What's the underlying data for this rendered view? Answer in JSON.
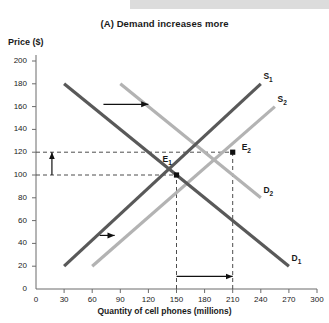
{
  "chart_data": {
    "type": "line",
    "title": "(A) Demand increases more",
    "xlabel": "Quantity of cell phones (millions)",
    "ylabel": "Price ($)",
    "xlim": [
      0,
      300
    ],
    "ylim": [
      0,
      200
    ],
    "xticks": [
      "0",
      "30",
      "60",
      "90",
      "120",
      "150",
      "180",
      "210",
      "240",
      "270",
      "300"
    ],
    "yticks": [
      "0",
      "20",
      "40",
      "60",
      "80",
      "100",
      "120",
      "140",
      "160",
      "180",
      "200"
    ],
    "grid": false,
    "legend_position": "inline-curve-labels",
    "series": [
      {
        "name": "D1",
        "label": "D",
        "sub": "1",
        "kind": "demand",
        "color": "#595959",
        "x": [
          30,
          270
        ],
        "y": [
          180,
          20
        ],
        "label_x": 276,
        "label_y": 26
      },
      {
        "name": "D2",
        "label": "D",
        "sub": "2",
        "kind": "demand",
        "color": "#b3b3b3",
        "x": [
          90,
          240
        ],
        "y": [
          180,
          80
        ],
        "label_x": 246,
        "label_y": 86
      },
      {
        "name": "S1",
        "label": "S",
        "sub": "1",
        "kind": "supply",
        "color": "#595959",
        "x": [
          30,
          240
        ],
        "y": [
          20,
          180
        ],
        "label_x": 246,
        "label_y": 186
      },
      {
        "name": "S2",
        "label": "S",
        "sub": "2",
        "kind": "supply",
        "color": "#b3b3b3",
        "x": [
          60,
          255
        ],
        "y": [
          20,
          160
        ],
        "label_x": 261,
        "label_y": 166
      }
    ],
    "points": [
      {
        "name": "E1",
        "label": "E",
        "sub": "1",
        "x": 150,
        "y": 100,
        "label_dx": -14,
        "label_dy": 15
      },
      {
        "name": "E2",
        "label": "E",
        "sub": "2",
        "x": 210,
        "y": 120,
        "label_dx": 9,
        "label_dy": 4
      }
    ],
    "guides": [
      {
        "name": "price-e1-guide",
        "orient": "h",
        "value": 100,
        "from": 0,
        "to": 150
      },
      {
        "name": "price-e2-guide",
        "orient": "h",
        "value": 120,
        "from": 0,
        "to": 210
      },
      {
        "name": "quantity-e1-guide",
        "orient": "v",
        "value": 150,
        "from": 0,
        "to": 100
      },
      {
        "name": "quantity-e2-guide",
        "orient": "v",
        "value": 210,
        "from": 0,
        "to": 120
      }
    ],
    "annotations": [
      {
        "name": "demand-shift-arrow",
        "dir": "right",
        "x1": 72,
        "y1": 162,
        "x2": 120,
        "y2": 162
      },
      {
        "name": "supply-shift-arrow",
        "dir": "right",
        "x1": 68,
        "y1": 47,
        "x2": 84,
        "y2": 47
      },
      {
        "name": "price-increase-arrow",
        "dir": "up",
        "x1": 17,
        "y1": 100,
        "x2": 17,
        "y2": 120
      },
      {
        "name": "quantity-increase-arrow",
        "dir": "right",
        "x1": 150,
        "y1": 11,
        "x2": 210,
        "y2": 11
      }
    ]
  }
}
